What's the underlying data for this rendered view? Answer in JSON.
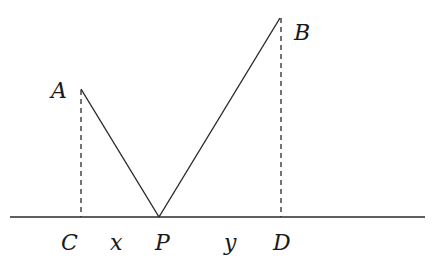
{
  "diagram": {
    "points": {
      "A": {
        "label": "A"
      },
      "B": {
        "label": "B"
      },
      "C": {
        "label": "C"
      },
      "P": {
        "label": "P"
      },
      "D": {
        "label": "D"
      }
    },
    "segment_labels": {
      "CP": "x",
      "PD": "y"
    },
    "line_color": "#2a2a2a",
    "text_color": "#1a1a1a"
  }
}
